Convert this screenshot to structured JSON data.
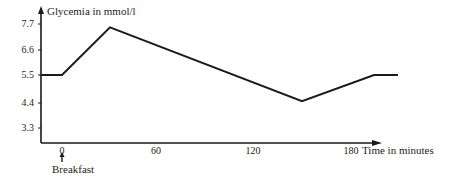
{
  "chart_data": {
    "type": "line",
    "title": "",
    "ylabel": "Glycemia in mmol/l",
    "xlabel": "Time in minutes",
    "x_ticks": [
      0,
      60,
      120,
      180
    ],
    "y_ticks": [
      3.3,
      4.4,
      5.5,
      6.6,
      7.7
    ],
    "xlim": [
      -13,
      210
    ],
    "ylim": [
      2.6,
      8.2
    ],
    "grid": false,
    "legend": null,
    "series": [
      {
        "name": "Glycemia",
        "x": [
          -13,
          0,
          30,
          150,
          195,
          210
        ],
        "y": [
          5.5,
          5.5,
          7.5,
          4.4,
          5.5,
          5.5
        ]
      }
    ],
    "annotations": [
      {
        "text": "Breakfast",
        "x": 0,
        "note": "arrow pointing up to t=0"
      }
    ]
  },
  "labels": {
    "y_axis": "Glycemia in mmol/l",
    "x_axis": "Time in minutes",
    "breakfast": "Breakfast",
    "y_ticks": [
      "7.7",
      "6.6",
      "5.5",
      "4.4",
      "3.3"
    ],
    "x_ticks": [
      "0",
      "60",
      "120",
      "180"
    ]
  },
  "colors": {
    "line": "#1a1a1a",
    "axis": "#1a1a1a",
    "background": "#ffffff"
  }
}
